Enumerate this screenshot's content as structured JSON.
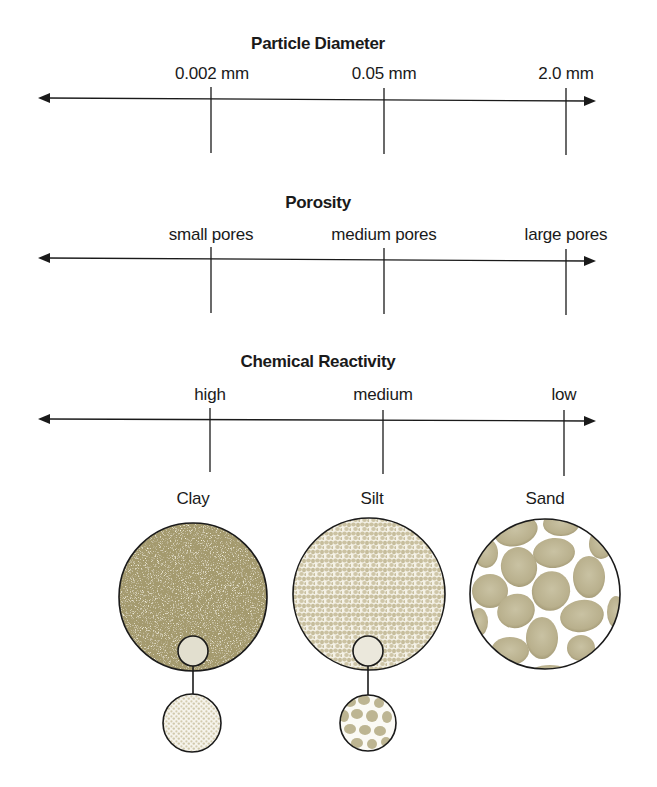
{
  "scales": [
    {
      "title": "Particle Diameter",
      "labels": [
        "0.002 mm",
        "0.05 mm",
        "2.0 mm"
      ]
    },
    {
      "title": "Porosity",
      "labels": [
        "small pores",
        "medium pores",
        "large pores"
      ]
    },
    {
      "title": "Chemical Reactivity",
      "labels": [
        "high",
        "medium",
        "low"
      ]
    }
  ],
  "soils": [
    {
      "name": "Clay",
      "color": "#a49a6e"
    },
    {
      "name": "Silt",
      "color": "#cfc6a6"
    },
    {
      "name": "Sand",
      "color": "#bdb492"
    }
  ],
  "colors": {
    "line": "#1a1a1a",
    "clay_fill": "#a49a6e",
    "silt_grain": "#cbc2a2",
    "sand_grain": "#b8b08c"
  }
}
